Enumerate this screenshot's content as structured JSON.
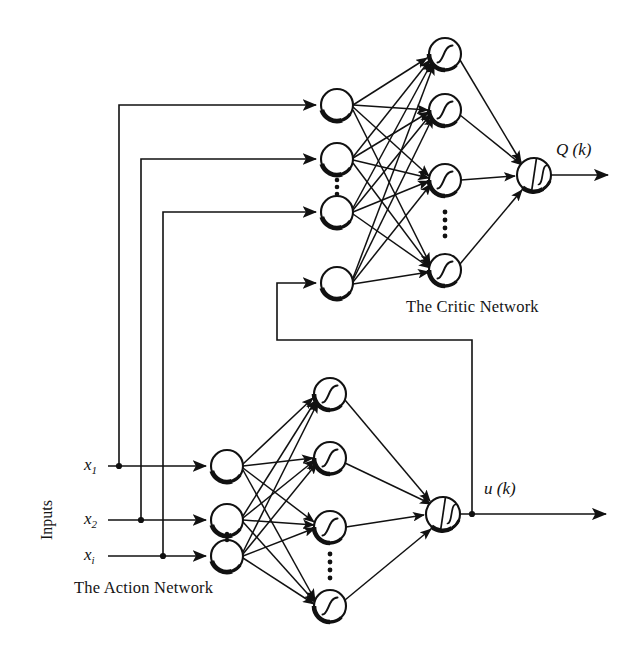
{
  "figure": {
    "type": "neural-network-diagram",
    "title_visible": false,
    "background_color": "#ffffff",
    "ink_color": "#111111"
  },
  "labels": {
    "critic_network": "The Critic Network",
    "action_network": "The Action Network",
    "inputs": "Inputs",
    "critic_output": "Q (k)",
    "action_output": "u (k)",
    "input_1": "x",
    "input_1_sub": "1",
    "input_2": "x",
    "input_2_sub": "2",
    "input_3": "x",
    "input_3_sub": "i",
    "sigma_glyph": "Σ",
    "vertical_dots": "⋮"
  },
  "critic_network": {
    "name": "The Critic Network",
    "input_nodes": [
      {
        "id": "c-in-1",
        "cx": 337,
        "cy": 105,
        "r": 16,
        "type": "plain-circle"
      },
      {
        "id": "c-in-2",
        "cx": 337,
        "cy": 159,
        "r": 16,
        "type": "plain-circle"
      },
      {
        "id": "c-in-3",
        "cx": 337,
        "cy": 212,
        "r": 16,
        "type": "plain-circle"
      },
      {
        "id": "c-in-4",
        "cx": 337,
        "cy": 283,
        "r": 16,
        "type": "plain-circle"
      }
    ],
    "input_ellipsis": {
      "cx": 337,
      "cy": 186
    },
    "hidden_nodes": [
      {
        "id": "c-hid-1",
        "cx": 445,
        "cy": 54,
        "r": 16,
        "type": "sigmoid-circle"
      },
      {
        "id": "c-hid-2",
        "cx": 445,
        "cy": 110,
        "r": 16,
        "type": "sigmoid-circle"
      },
      {
        "id": "c-hid-3",
        "cx": 445,
        "cy": 180,
        "r": 16,
        "type": "sigmoid-circle"
      },
      {
        "id": "c-hid-4",
        "cx": 445,
        "cy": 270,
        "r": 16,
        "type": "sigmoid-circle"
      }
    ],
    "hidden_ellipsis": {
      "cx": 445,
      "cy": 225
    },
    "output_node": {
      "id": "c-out",
      "cx": 534,
      "cy": 175,
      "r": 17,
      "type": "sum-sigmoid-circle"
    },
    "output_label": "Q (k)",
    "output_arrow_end_x": 612
  },
  "action_network": {
    "name": "The Action Network",
    "input_nodes": [
      {
        "id": "a-in-1",
        "cx": 227,
        "cy": 466,
        "r": 16,
        "type": "plain-circle"
      },
      {
        "id": "a-in-2",
        "cx": 227,
        "cy": 520,
        "r": 16,
        "type": "plain-circle"
      },
      {
        "id": "a-in-3",
        "cx": 227,
        "cy": 556,
        "r": 16,
        "type": "plain-circle"
      }
    ],
    "input_ellipsis": {
      "cx": 227,
      "cy": 540
    },
    "hidden_nodes": [
      {
        "id": "a-hid-1",
        "cx": 330,
        "cy": 394,
        "r": 16,
        "type": "sigmoid-circle"
      },
      {
        "id": "a-hid-2",
        "cx": 330,
        "cy": 458,
        "r": 16,
        "type": "sigmoid-circle"
      },
      {
        "id": "a-hid-3",
        "cx": 330,
        "cy": 527,
        "r": 16,
        "type": "sigmoid-circle"
      },
      {
        "id": "a-hid-4",
        "cx": 330,
        "cy": 606,
        "r": 16,
        "type": "sigmoid-circle"
      }
    ],
    "hidden_ellipsis": {
      "cx": 330,
      "cy": 567
    },
    "output_node": {
      "id": "a-out",
      "cx": 443,
      "cy": 514,
      "r": 17,
      "type": "sum-sigmoid-circle"
    },
    "output_label": "u (k)",
    "output_arrow_end_x": 610,
    "output_tap_x": 472
  },
  "inputs": {
    "label": "Inputs",
    "lines": [
      {
        "name": "x1",
        "label_x": 88,
        "y": 466,
        "tap_x": 119,
        "feedback_line_x": 119
      },
      {
        "name": "x2",
        "label_x": 88,
        "y": 520,
        "tap_x": 141,
        "feedback_line_x": 141
      },
      {
        "name": "xi",
        "label_x": 88,
        "y": 556,
        "tap_x": 163,
        "feedback_line_x": 163
      }
    ],
    "arrow_target_x": 209
  },
  "feedback_paths": [
    {
      "from": "x1",
      "to": "critic-input-1",
      "corner_y": 105,
      "vertical_x": 119
    },
    {
      "from": "x2",
      "to": "critic-input-2",
      "corner_y": 159,
      "vertical_x": 141
    },
    {
      "from": "xi",
      "to": "critic-input-3",
      "corner_y": 212,
      "vertical_x": 163
    },
    {
      "from": "u(k)",
      "to": "critic-input-4",
      "corner_y": 283,
      "vertical_x": 277,
      "bottom_y": 340,
      "riser_x": 472
    }
  ]
}
